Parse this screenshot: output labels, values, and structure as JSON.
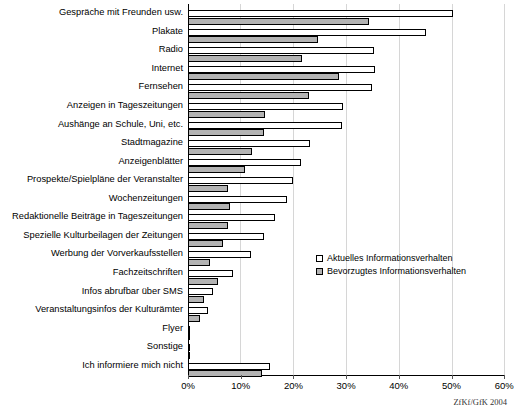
{
  "chart_data": {
    "type": "bar",
    "orientation": "horizontal",
    "title": "",
    "xlabel": "",
    "ylabel": "",
    "xlim": [
      0,
      60
    ],
    "xticks": [
      "0%",
      "10%",
      "20%",
      "30%",
      "40%",
      "50%",
      "60%"
    ],
    "xtick_values": [
      0,
      10,
      20,
      30,
      40,
      50,
      60
    ],
    "grid": true,
    "legend_position": "center-right",
    "categories": [
      "Gespräche mit Freunden usw.",
      "Plakate",
      "Radio",
      "Internet",
      "Fernsehen",
      "Anzeigen in Tageszeitungen",
      "Aushänge an Schule, Uni, etc.",
      "Stadtmagazine",
      "Anzeigenblätter",
      "Prospekte/Spielpläne der Veranstalter",
      "Wochenzeitungen",
      "Redaktionelle Beiträge in Tageszeitungen",
      "Spezielle Kulturbeilagen der Zeitungen",
      "Werbung der Vorverkaufsstellen",
      "Fachzeitschriften",
      "Infos abrufbar über SMS",
      "Veranstaltungsinfos der Kulturämter",
      "Flyer",
      "Sonstige",
      "Ich informiere mich nicht"
    ],
    "series": [
      {
        "name": "Aktuelles Informationsverhalten",
        "color": "#ffffff",
        "values": [
          50.3,
          45.1,
          35.2,
          35.4,
          35.0,
          29.5,
          29.2,
          23.2,
          21.5,
          20.0,
          18.8,
          16.6,
          14.5,
          12.0,
          8.5,
          4.8,
          3.8,
          0.4,
          0.3,
          15.6
        ]
      },
      {
        "name": "Bevorzugtes Informationsverhalten",
        "color": "#b3b3b3",
        "values": [
          34.3,
          24.6,
          21.7,
          28.6,
          22.9,
          14.7,
          14.5,
          12.2,
          10.9,
          7.6,
          7.9,
          7.5,
          6.6,
          4.2,
          5.7,
          3.1,
          2.3,
          0.3,
          0.2,
          14.1
        ]
      }
    ],
    "source_note": "ZfKf/GfK 2004"
  }
}
